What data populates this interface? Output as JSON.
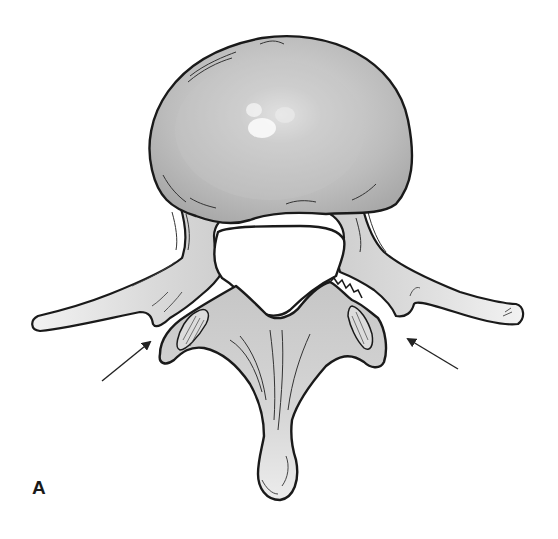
{
  "figure": {
    "panel_label": "A",
    "arrows": [
      {
        "name": "left-arrow",
        "from": [
          102,
          381
        ],
        "to": [
          152,
          340
        ]
      },
      {
        "name": "right-arrow",
        "from": [
          458,
          369
        ],
        "to": [
          406,
          338
        ]
      }
    ],
    "colors": {
      "outline": "#1a1a1a",
      "body_fill": "#bdbdbd",
      "body_highlight": "#e6e6e6",
      "bone_fill": "#d4d4d4",
      "bone_light": "#ececec",
      "canal_fill": "#ffffff",
      "background": "#ffffff"
    }
  }
}
